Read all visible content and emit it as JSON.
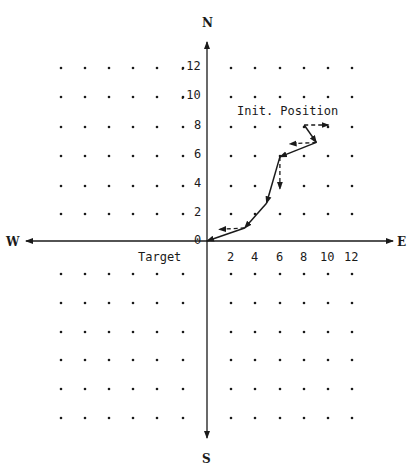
{
  "compass": {
    "north": "N",
    "south": "S",
    "east": "E",
    "west": "W"
  },
  "labels": {
    "target": "Target",
    "initial_position": "Init. Position"
  },
  "y_ticks": [
    ".12",
    ".10",
    "8",
    "6",
    "4",
    "2",
    "0"
  ],
  "x_ticks": [
    "2",
    "4",
    "6",
    "8",
    "10",
    "12"
  ],
  "colors": {
    "ink": "#1a1a1a",
    "background": "#ffffff"
  },
  "chart_data": {
    "type": "line",
    "title": "",
    "xlabel": "E",
    "ylabel": "N",
    "axes": {
      "x_range": [
        -12,
        12
      ],
      "y_range": [
        -12,
        12
      ],
      "grid": "dot grid every 2 units"
    },
    "annotations": [
      {
        "text": "Init. Position",
        "at": [
          8,
          8
        ]
      },
      {
        "text": "Target",
        "at": [
          0,
          0
        ]
      }
    ],
    "series": [
      {
        "name": "trajectory (solid)",
        "points": [
          [
            8,
            8
          ],
          [
            9,
            6.8
          ],
          [
            6,
            5.8
          ],
          [
            4.9,
            2.6
          ],
          [
            3.1,
            0.9
          ],
          [
            0,
            0
          ]
        ]
      }
    ],
    "dashed_arrows": [
      {
        "from": [
          8,
          8
        ],
        "to": [
          10,
          8
        ],
        "direction": "E"
      },
      {
        "from": [
          9,
          6.8
        ],
        "to": [
          6.8,
          6.7
        ],
        "direction": "W"
      },
      {
        "from": [
          6,
          5.8
        ],
        "to": [
          6,
          3.6
        ],
        "direction": "S"
      },
      {
        "from": [
          3.1,
          0.9
        ],
        "to": [
          1,
          0.8
        ],
        "direction": "W"
      }
    ]
  }
}
